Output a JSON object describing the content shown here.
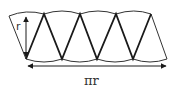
{
  "diagram": {
    "labels": {
      "height": "r",
      "width": "πr"
    },
    "colors": {
      "stroke": "#1a1a1a",
      "arc": "#333333",
      "background": "#ffffff"
    },
    "sectors": {
      "count": 8,
      "top_vertices": [
        [
          9,
          15
        ],
        [
          44,
          14
        ],
        [
          80,
          14
        ],
        [
          116,
          14
        ],
        [
          151,
          14
        ]
      ],
      "bottom_vertices": [
        [
          26,
          59
        ],
        [
          62,
          59
        ],
        [
          97,
          59
        ],
        [
          133,
          59
        ],
        [
          167,
          59
        ]
      ]
    },
    "arrows": [
      {
        "name": "radius-arrow",
        "from": [
          26,
          15
        ],
        "to": [
          26,
          58
        ],
        "double": true
      },
      {
        "name": "width-arrow",
        "from": [
          27,
          66
        ],
        "to": [
          167,
          66
        ],
        "double": true
      }
    ]
  }
}
